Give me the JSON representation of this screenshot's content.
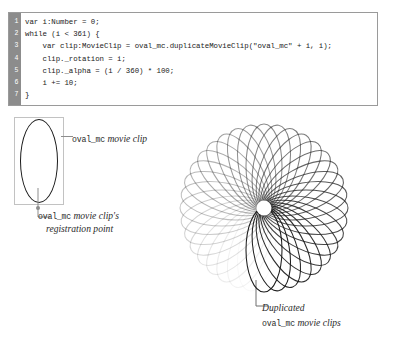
{
  "code_panel": {
    "line_numbers": [
      "1",
      "2",
      "3",
      "4",
      "5",
      "6",
      "7"
    ],
    "lines": [
      "var i:Number = 0;",
      "while (i < 361) {",
      "    var clip:MovieClip = oval_mc.duplicateMovieClip(\"oval_mc\" + i, i);",
      "    clip._rotation = i;",
      "    clip._alpha = (i / 360) * 100;",
      "    i += 10;",
      "}"
    ],
    "gutter_color": "#8c8c8c",
    "border_color": "#9a9a9a",
    "text_color": "#1b1b1b"
  },
  "annotations": {
    "source_clip": {
      "code_text": "oval_mc",
      "italic_text": " movie clip"
    },
    "registration_point": {
      "code_text": "oval_mc",
      "italic_text": " movie clip's",
      "italic_line2": "registration point"
    },
    "duplicated_clips": {
      "italic_line1": "Duplicated",
      "code_text": "oval_mc",
      "italic_text": " movie clips"
    }
  },
  "diagram": {
    "oval_stroke": "#1a1a1a",
    "bbox_stroke": "#c2c2c2",
    "leader_color": "#8d8d8d",
    "registration_dot_color": "#8d8d8d"
  },
  "chart_data": {
    "type": "scatter",
    "title": "Duplicated oval_mc movie clips",
    "rotation_start": 0,
    "rotation_step": 10,
    "rotation_end": 360,
    "alpha_formula": "(i / 360) * 100",
    "instance_count": 36,
    "oval_width": 36,
    "oval_height": 84,
    "center_x": 98,
    "center_y": 94,
    "stroke_color": "#1a1a1a",
    "alpha_min": 0,
    "alpha_max": 100
  }
}
